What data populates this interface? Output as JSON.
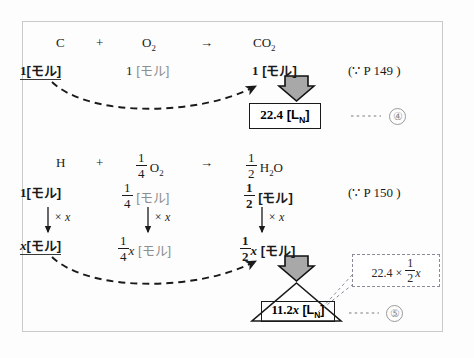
{
  "diagram": {
    "title_note_1": "(∵ P 149 )",
    "title_note_2": "(∵ P 150 )",
    "eq1": {
      "reactant_a": "C",
      "plus": "+",
      "reactant_b_formula": "O",
      "reactant_b_sub": "2",
      "arrow": "→",
      "product_formula": "CO",
      "product_sub": "2",
      "mol_a": "1",
      "mol_a_unit": "[モル]",
      "mol_b": "1",
      "mol_b_unit": "[モル]",
      "mol_c": "1",
      "mol_c_unit": "[モル]",
      "result_value": "22.4",
      "result_unit_open": "[L",
      "result_unit_sub": "N",
      "result_unit_close": "]",
      "marker": "④",
      "leader": "......"
    },
    "eq2": {
      "reactant_a": "H",
      "plus": "+",
      "coef_b_num": "1",
      "coef_b_den": "4",
      "reactant_b_formula": "O",
      "reactant_b_sub": "2",
      "arrow": "→",
      "coef_c_num": "1",
      "coef_c_den": "2",
      "product_formula": "H",
      "product_sub": "2",
      "product_tail": "O",
      "mol_a": "1",
      "mol_a_unit": "[モル]",
      "mol_b_num": "1",
      "mol_b_den": "4",
      "mol_b_unit": "[モル]",
      "mol_c_num": "1",
      "mol_c_den": "2",
      "mol_c_unit": "[モル]",
      "multiplier_a": "× x",
      "multiplier_b": "× x",
      "multiplier_c": "× x",
      "scaled_a": "x",
      "scaled_a_unit": "[モル]",
      "scaled_b_num": "1",
      "scaled_b_den": "4",
      "scaled_b_var": "x",
      "scaled_b_unit": "[モル]",
      "scaled_c_num": "1",
      "scaled_c_den": "2",
      "scaled_c_var": "x",
      "scaled_c_unit": "[モル]",
      "result_value": "11.2",
      "result_var": "x",
      "result_unit_open": "[L",
      "result_unit_sub": "N",
      "result_unit_close": "]",
      "marker": "⑤",
      "leader": "......",
      "callout_lead": "22.4 ×",
      "callout_num": "1",
      "callout_den": "2",
      "callout_var": "x"
    }
  },
  "colors": {
    "frame_border": "#c9c9c9",
    "ink": "#1a1a1a",
    "gray_text": "#8e8e8e",
    "fat_arrow_fill": "#a8a8a8",
    "dash_callout_border": "#8a8a9a"
  }
}
